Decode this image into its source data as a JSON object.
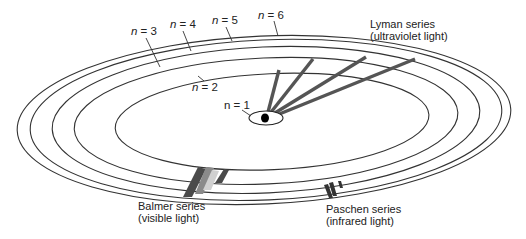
{
  "diagram": {
    "levels": [
      {
        "n": 1,
        "label_prefix": "n",
        "label_value": "= 1"
      },
      {
        "n": 2,
        "label_prefix": "n",
        "label_value": "= 2"
      },
      {
        "n": 3,
        "label_prefix": "n",
        "label_value": "= 3"
      },
      {
        "n": 4,
        "label_prefix": "n",
        "label_value": "= 4"
      },
      {
        "n": 5,
        "label_prefix": "n",
        "label_value": "= 5"
      },
      {
        "n": 6,
        "label_prefix": "n",
        "label_value": "= 6"
      }
    ],
    "series": [
      {
        "name": "Lyman series",
        "region": "(ultraviolet light)",
        "final_level": 1,
        "transitions": 4
      },
      {
        "name": "Balmer series",
        "region": "(visible light)",
        "final_level": 2,
        "transitions": 4
      },
      {
        "name": "Paschen series",
        "region": "(infrared light)",
        "final_level": 3,
        "transitions": 3
      }
    ],
    "colors": {
      "orbit": "#333333",
      "lyman": "#555555",
      "balmer_dark": "#4a4a4a",
      "balmer_mid": "#8a8a8a",
      "balmer_light": "#d0d0d0",
      "paschen": "#333333",
      "nucleus": "#000000"
    }
  }
}
